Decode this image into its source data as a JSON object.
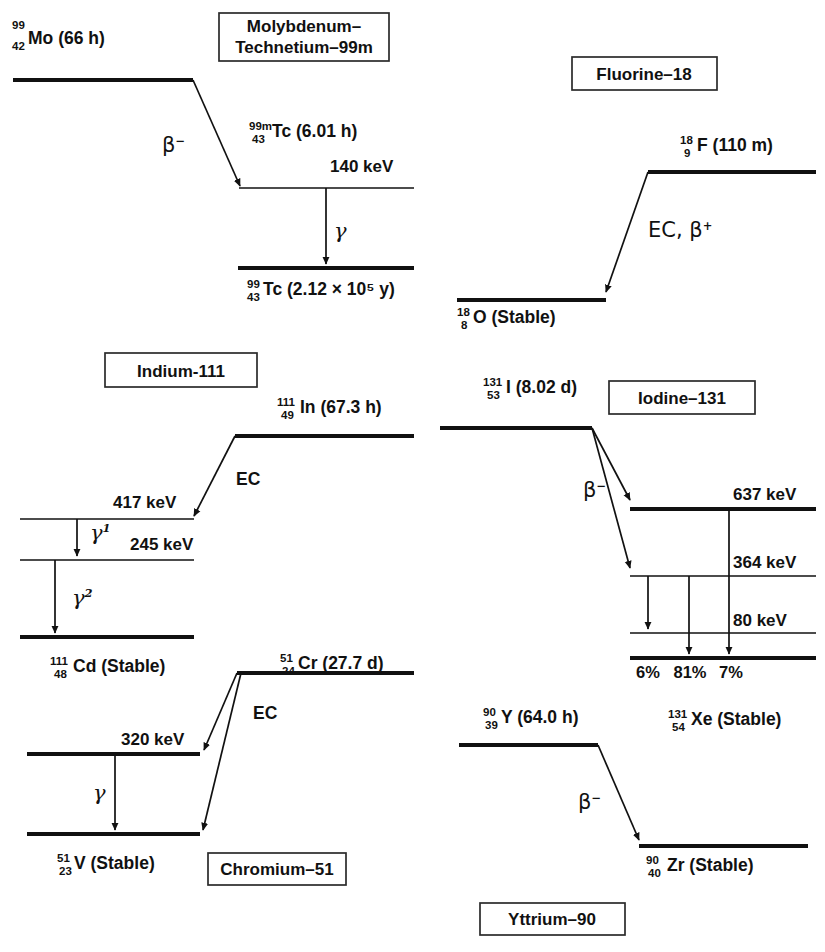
{
  "figure": {
    "line_color": "#111111",
    "background": "#ffffff"
  },
  "schemes": [
    {
      "id": "molybdenum-technetium-99m",
      "box_label_line1": "Molybdenum–",
      "box_label_line2": "Technetium–99m",
      "parent": {
        "mass": "99",
        "atomic": "42",
        "symbol": "Mo",
        "half_life": "(66 h)"
      },
      "levels": [
        {
          "name": "Tc-99m",
          "mass": "99m",
          "atomic": "43",
          "symbol": "Tc",
          "half_life": "(6.01 h)",
          "energy": "140 keV"
        },
        {
          "name": "Tc-99 ground",
          "mass": "99",
          "atomic": "43",
          "symbol": "Tc",
          "half_life": "(2.12 × 10⁵ y)",
          "energy": ""
        }
      ],
      "transitions": [
        {
          "type": "beta-minus",
          "label": "β",
          "label_sup": "−"
        },
        {
          "type": "gamma",
          "label": "γ",
          "label_sup": ""
        }
      ]
    },
    {
      "id": "fluorine-18",
      "box_label_line1": "Fluorine–18",
      "box_label_line2": "",
      "parent": {
        "mass": "18",
        "atomic": "9",
        "symbol": "F",
        "half_life": "(110 m)"
      },
      "levels": [
        {
          "name": "O-18 ground",
          "mass": "18",
          "atomic": "8",
          "symbol": "O",
          "half_life": "(Stable)",
          "energy": ""
        }
      ],
      "transitions": [
        {
          "type": "ec-beta-plus",
          "label": "EC, β",
          "label_sup": "+"
        }
      ]
    },
    {
      "id": "indium-111",
      "box_label_line1": "Indium-111",
      "box_label_line2": "",
      "parent": {
        "mass": "111",
        "atomic": "49",
        "symbol": "In",
        "half_life": "(67.3 h)"
      },
      "levels": [
        {
          "name": "417 level",
          "energy": "417 keV"
        },
        {
          "name": "245 level",
          "energy": "245 keV"
        },
        {
          "name": "Cd-111 ground",
          "mass": "111",
          "atomic": "48",
          "symbol": "Cd",
          "half_life": "(Stable)",
          "energy": ""
        }
      ],
      "transitions": [
        {
          "type": "ec",
          "label": "EC",
          "label_sup": ""
        },
        {
          "type": "gamma",
          "label": "γ",
          "label_sup": "1"
        },
        {
          "type": "gamma",
          "label": "γ",
          "label_sup": "2"
        }
      ]
    },
    {
      "id": "iodine-131",
      "box_label_line1": "Iodine–131",
      "box_label_line2": "",
      "parent": {
        "mass": "131",
        "atomic": "53",
        "symbol": "I",
        "half_life": "(8.02 d)"
      },
      "levels": [
        {
          "name": "637 level",
          "energy": "637 keV"
        },
        {
          "name": "364 level",
          "energy": "364 keV"
        },
        {
          "name": "80 level",
          "energy": "80 keV"
        },
        {
          "name": "Xe-131 ground",
          "mass": "131",
          "atomic": "54",
          "symbol": "Xe",
          "half_life": "(Stable)",
          "energy": ""
        }
      ],
      "transitions": [
        {
          "type": "beta-minus",
          "label": "β",
          "label_sup": "−"
        }
      ],
      "branch_percentages": [
        "6%",
        "81%",
        "7%"
      ]
    },
    {
      "id": "chromium-51",
      "box_label_line1": "Chromium–51",
      "box_label_line2": "",
      "parent": {
        "mass": "51",
        "atomic": "24",
        "symbol": "Cr",
        "half_life": "(27.7 d)"
      },
      "levels": [
        {
          "name": "320 level",
          "energy": "320 keV"
        },
        {
          "name": "V-51 ground",
          "mass": "51",
          "atomic": "23",
          "symbol": "V",
          "half_life": "(Stable)",
          "energy": ""
        }
      ],
      "transitions": [
        {
          "type": "ec",
          "label": "EC",
          "label_sup": ""
        },
        {
          "type": "gamma",
          "label": "γ",
          "label_sup": ""
        }
      ]
    },
    {
      "id": "yttrium-90",
      "box_label_line1": "Yttrium–90",
      "box_label_line2": "",
      "parent": {
        "mass": "90",
        "atomic": "39",
        "symbol": "Y",
        "half_life": "(64.0 h)"
      },
      "levels": [
        {
          "name": "Zr-90 ground",
          "mass": "90",
          "atomic": "40",
          "symbol": "Zr",
          "half_life": "(Stable)",
          "energy": ""
        }
      ],
      "transitions": [
        {
          "type": "beta-minus",
          "label": "β",
          "label_sup": "−"
        }
      ]
    }
  ],
  "text": {
    "mo99_parent_mass": "99",
    "mo99_parent_atomic": "42",
    "mo99_parent_main": "Mo (66 h)",
    "tc99m_mass": "99m",
    "tc99m_atomic": "43",
    "tc99m_main": "Tc (6.01 h)",
    "tc99m_energy": "140 keV",
    "tc99_mass": "99",
    "tc99_atomic": "43",
    "tc99_main": "Tc (2.12 × 10⁵ y)",
    "mo_box_l1": "Molybdenum–",
    "mo_box_l2": "Technetium–99m",
    "beta_minus": "β",
    "beta_minus_sup": "−",
    "gamma": "γ",
    "f18_box": "Fluorine–18",
    "f18_mass": "18",
    "f18_atomic": "9",
    "f18_main": "F (110 m)",
    "o18_mass": "18",
    "o18_atomic": "8",
    "o18_main": "O (Stable)",
    "ec_beta_plus": "EC, β",
    "ec_beta_plus_sup": "+",
    "in111_box": "Indium-111",
    "in111_mass": "111",
    "in111_atomic": "49",
    "in111_main": "In (67.3 h)",
    "in_417": "417 keV",
    "in_245": "245 keV",
    "cd111_mass": "111",
    "cd111_atomic": "48",
    "cd111_main": "Cd (Stable)",
    "ec": "EC",
    "gamma1_sup": "1",
    "gamma2_sup": "2",
    "i131_box": "Iodine–131",
    "i131_mass": "131",
    "i131_atomic": "53",
    "i131_main": "I (8.02 d)",
    "i_637": "637 keV",
    "i_364": "364 keV",
    "i_80": "80 keV",
    "pct1": "6%",
    "pct2": "81%",
    "pct3": "7%",
    "xe131_mass": "131",
    "xe131_atomic": "54",
    "xe131_main": "Xe (Stable)",
    "cr51_box": "Chromium–51",
    "cr51_mass": "51",
    "cr51_atomic": "24",
    "cr51_main": "Cr (27.7 d)",
    "cr_320": "320 keV",
    "v51_mass": "51",
    "v51_atomic": "23",
    "v51_main": "V (Stable)",
    "y90_box": "Yttrium–90",
    "y90_mass": "90",
    "y90_atomic": "39",
    "y90_main": "Y (64.0 h)",
    "zr90_mass": "90",
    "zr90_atomic": "40",
    "zr90_main": "Zr (Stable)"
  }
}
